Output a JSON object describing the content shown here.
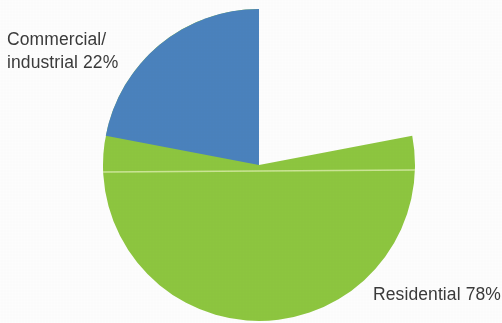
{
  "chart_data": {
    "type": "pie",
    "title": "",
    "subtitle": "",
    "xlabel": "",
    "ylabel": "",
    "legend_position": "none",
    "grid": false,
    "labels_inline": true,
    "categories": [
      "Residential",
      "Commercial/industrial"
    ],
    "values": [
      78,
      22
    ],
    "unit": "%",
    "slices": [
      {
        "name": "Residential",
        "value": 78,
        "label": "Residential 78%",
        "color": "#8dc63f",
        "start_angle_deg": 0,
        "sweep_deg": 280.8,
        "direction": "counter-clockwise"
      },
      {
        "name": "Commercial/industrial",
        "value": 22,
        "label_line1": "Commercial/",
        "label_line2": "industrial 22%",
        "label": "Commercial/industrial 22%",
        "color": "#4a82bd",
        "start_angle_deg": 0,
        "sweep_deg": 79.2,
        "direction": "counter-clockwise"
      }
    ],
    "geometry": {
      "center_x": 259,
      "center_y": 165,
      "radius": 156
    }
  },
  "labels": {
    "commercial_line1": "Commercial/",
    "commercial_line2": "industrial 22%",
    "residential": "Residential 78%"
  },
  "colors": {
    "slice_residential": "#8dc63f",
    "slice_commercial": "#4a82bd",
    "text": "#3a3a3a",
    "background": "#fdfdfd",
    "separator_line": "#d7eba6"
  }
}
